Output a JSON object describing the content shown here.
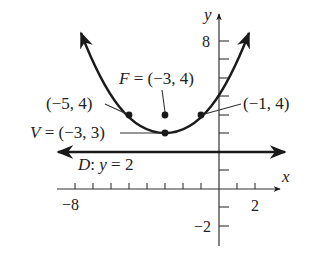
{
  "diagram": {
    "type": "parabola-graph",
    "equation_description": "Parabola with vertex V and focus F, directrix D",
    "axes": {
      "x_label": "x",
      "y_label": "y",
      "x_tick_labels": [
        {
          "value": -8,
          "text": "−8"
        },
        {
          "value": 2,
          "text": "2"
        }
      ],
      "y_tick_labels": [
        {
          "value": 8,
          "text": "8"
        },
        {
          "value": -2,
          "text": "−2"
        }
      ],
      "x_range": [
        -8.5,
        3.4
      ],
      "y_range": [
        -3,
        9
      ]
    },
    "points": {
      "focus": {
        "label": "F = (−3, 4)",
        "x": -3,
        "y": 4
      },
      "vertex": {
        "label": "V = (−3, 3)",
        "x": -3,
        "y": 3
      },
      "left": {
        "label": "(−5, 4)",
        "x": -5,
        "y": 4
      },
      "right": {
        "label": "(−1, 4)",
        "x": -1,
        "y": 4
      }
    },
    "directrix": {
      "label": "D: y = 2",
      "y": 2
    },
    "colors": {
      "ink": "#1a1a1a",
      "text": "#222222",
      "background": "#ffffff"
    }
  }
}
